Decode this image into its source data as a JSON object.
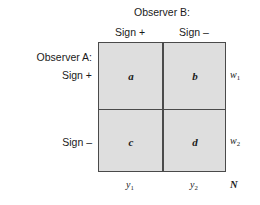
{
  "figure": {
    "type": "2x2-contingency-table",
    "column_header_title": "Observer B:",
    "row_header_title": "Observer A:",
    "column_headers": [
      "Sign +",
      "Sign –"
    ],
    "row_headers": [
      "Sign +",
      "Sign –"
    ],
    "cells": [
      {
        "key": "a",
        "label": "a",
        "row": 0,
        "col": 0
      },
      {
        "key": "b",
        "label": "b",
        "row": 0,
        "col": 1
      },
      {
        "key": "c",
        "label": "c",
        "row": 1,
        "col": 0
      },
      {
        "key": "d",
        "label": "d",
        "row": 1,
        "col": 1
      }
    ],
    "row_totals": [
      {
        "base": "w",
        "sub": "1"
      },
      {
        "base": "w",
        "sub": "2"
      }
    ],
    "column_totals": [
      {
        "base": "y",
        "sub": "1"
      },
      {
        "base": "y",
        "sub": "2"
      }
    ],
    "grand_total": "N",
    "colors": {
      "cell_fill": "#dedede",
      "rule": "#4a4a4a",
      "background": "#ffffff",
      "text": "#1a1a1a"
    }
  }
}
